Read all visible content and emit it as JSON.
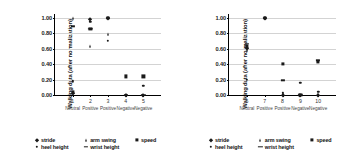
{
  "figure": {
    "panels": [
      {
        "name": "left-panel",
        "chart_data": {
          "type": "scatter",
          "title": "",
          "xlabel": "",
          "ylabel": "Walking data (after normalization)",
          "ylim": [
            0.0,
            1.05
          ],
          "yticks": [
            0.0,
            0.2,
            0.4,
            0.6,
            0.8,
            1.0
          ],
          "ytick_labels": [
            "0.00",
            "0.20",
            "0.40",
            "0.60",
            "0.80",
            "1.00"
          ],
          "grid": true,
          "legend_position": "below",
          "x": [
            1,
            2,
            3,
            4,
            5
          ],
          "xtick_labels": [
            "1",
            "2",
            "3",
            "4",
            "5"
          ],
          "xcategory_labels": [
            "Neutral",
            "Positive",
            "Positive",
            "Negative",
            "Negative"
          ],
          "series": [
            {
              "name": "stride",
              "marker": "diamond",
              "values": [
                0.02,
                0.99,
                1.0,
                0.0,
                0.0
              ]
            },
            {
              "name": "heel height",
              "marker": "dot",
              "values": [
                0.18,
                0.95,
                0.7,
                0.0,
                0.12
              ]
            },
            {
              "name": "arm swing",
              "marker": "triangle",
              "values": [
                1.0,
                0.64,
                0.79,
                0.0,
                0.0
              ]
            },
            {
              "name": "wrist height",
              "marker": "dash",
              "values": [
                0.89,
                0.86,
                1.0,
                0.0,
                0.0
              ]
            },
            {
              "name": "speed",
              "marker": "square",
              "values": [
                0.04,
                0.86,
                1.0,
                0.24,
                0.24
              ]
            }
          ]
        },
        "legend": [
          {
            "label": "stride",
            "marker": "diamond"
          },
          {
            "label": "arm swing",
            "marker": "triangle"
          },
          {
            "label": "speed",
            "marker": "square"
          },
          {
            "label": "heel height",
            "marker": "dot"
          },
          {
            "label": "wrist height",
            "marker": "dash"
          }
        ]
      },
      {
        "name": "right-panel",
        "chart_data": {
          "type": "scatter",
          "title": "",
          "xlabel": "",
          "ylabel": "Walking data (after normalization)",
          "ylim": [
            0.0,
            1.05
          ],
          "yticks": [
            0.0,
            0.2,
            0.4,
            0.6,
            0.8,
            1.0
          ],
          "ytick_labels": [
            "0.00",
            "0.20",
            "0.40",
            "0.60",
            "0.80",
            "1.00"
          ],
          "grid": true,
          "legend_position": "below",
          "x": [
            6,
            7,
            8,
            9,
            10
          ],
          "xtick_labels": [
            "6",
            "7",
            "8",
            "9",
            "10"
          ],
          "xcategory_labels": [
            "Neutral",
            "Positive",
            "Positive",
            "Negative",
            "Negative"
          ],
          "series": [
            {
              "name": "stride",
              "marker": "diamond",
              "values": [
                0.61,
                1.0,
                0.0,
                0.0,
                0.0
              ]
            },
            {
              "name": "heel height",
              "marker": "dot",
              "values": [
                0.2,
                1.0,
                0.03,
                0.16,
                0.04
              ]
            },
            {
              "name": "arm swing",
              "marker": "triangle",
              "values": [
                0.58,
                1.0,
                0.02,
                0.0,
                0.01
              ]
            },
            {
              "name": "wrist height",
              "marker": "dash",
              "values": [
                0.66,
                1.0,
                0.19,
                0.0,
                0.45
              ]
            },
            {
              "name": "speed",
              "marker": "square",
              "values": [
                0.63,
                1.0,
                0.4,
                0.0,
                0.43
              ]
            }
          ]
        },
        "legend": [
          {
            "label": "stride",
            "marker": "diamond"
          },
          {
            "label": "arm swing",
            "marker": "triangle"
          },
          {
            "label": "speed",
            "marker": "square"
          },
          {
            "label": "heel height",
            "marker": "dot"
          },
          {
            "label": "wrist height",
            "marker": "dash"
          }
        ]
      }
    ]
  }
}
